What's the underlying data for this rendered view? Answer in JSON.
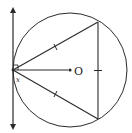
{
  "diagram": {
    "type": "geometry",
    "labels": {
      "center": "O",
      "angle": "x"
    },
    "colors": {
      "stroke": "#2a2a2a",
      "background": "#ffffff"
    },
    "elements": {
      "circle": {
        "cx": 70,
        "cy": 70,
        "r": 57
      },
      "tangent_line": {
        "x": 13,
        "y1": 8,
        "y2": 129,
        "arrows": "both"
      },
      "triangle": {
        "vertices": [
          [
            13,
            70
          ],
          [
            98,
            22
          ],
          [
            98,
            119
          ]
        ],
        "equal_side_tick_marks": 3
      },
      "radius": {
        "from": [
          13,
          70
        ],
        "to": [
          69,
          70
        ]
      },
      "right_angle_marker": {
        "at": [
          13,
          70
        ],
        "size": 5
      }
    }
  }
}
